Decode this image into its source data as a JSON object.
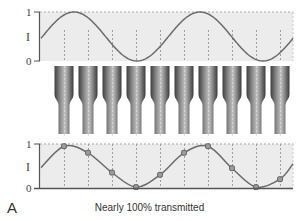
{
  "figure": {
    "panel_label": "A",
    "caption": "Nearly 100% transmitted",
    "colors": {
      "plot_bg": "#ececec",
      "curve": "#6b6b6b",
      "axis": "#555555",
      "gridline": "#a8a8a8",
      "fiber_dark": "#4a4a4a",
      "fiber_light": "#b5b5b5",
      "marker_fill": "#9a9a9a",
      "marker_stroke": "#555555"
    },
    "fiber_count": 10
  },
  "top_plot": {
    "y_tick_top": "1",
    "y_tick_bottom": "0",
    "y_label": "I",
    "description": "Continuous sinusoidal intensity input"
  },
  "bottom_plot": {
    "y_tick_top": "1",
    "y_tick_bottom": "0",
    "y_label": "I",
    "description": "Intensity sampled at each fiber"
  },
  "chart_data": [
    {
      "type": "line",
      "title": "Input intensity",
      "xlabel": "",
      "ylabel": "I",
      "ylim": [
        0,
        1
      ],
      "y_ticks": [
        "0",
        "1"
      ],
      "grid": true,
      "series": [
        {
          "name": "input",
          "description": "sine wave, ~2.1 periods across plot, starting near 0.5 rising",
          "cycles": 2.1,
          "phase_start": 0.5,
          "amplitude": 0.5,
          "offset": 0.5
        }
      ]
    },
    {
      "type": "line",
      "title": "Transmitted intensity (sampled)",
      "xlabel": "",
      "ylabel": "I",
      "ylim": [
        0,
        1
      ],
      "y_ticks": [
        "0",
        "1"
      ],
      "grid": true,
      "x": [
        1,
        2,
        3,
        4,
        5,
        6,
        7,
        8,
        9,
        10
      ],
      "series": [
        {
          "name": "samples",
          "values": [
            0.95,
            0.8,
            0.35,
            0.02,
            0.3,
            0.8,
            0.95,
            0.45,
            0.02,
            0.2
          ]
        }
      ]
    }
  ]
}
